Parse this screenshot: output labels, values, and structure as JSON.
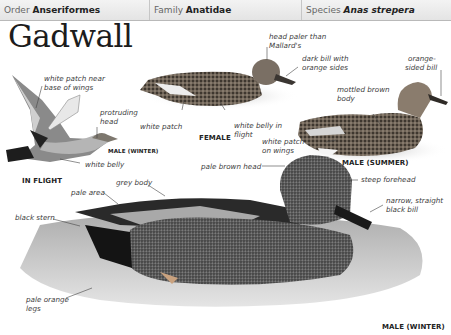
{
  "header": {
    "order_label": "Order",
    "order_value": "Anseriformes",
    "family_label": "Family",
    "family_value": "Anatidae",
    "species_label": "Species",
    "species_value": "Anas strepera"
  },
  "title": "Gadwall",
  "illustrations": {
    "in_flight": {
      "caption": "IN FLIGHT",
      "sub_caption": "MALE (WINTER)",
      "labels": [
        "white patch near",
        "base of wings",
        "protruding",
        "head",
        "white belly"
      ]
    },
    "female": {
      "caption": "FEMALE",
      "labels": [
        "head paler than",
        "Mallard's",
        "dark bill with",
        "orange sides",
        "white patch",
        "white belly in",
        "flight"
      ]
    },
    "male_summer": {
      "caption": "MALE (SUMMER)",
      "labels": [
        "orange-",
        "sided bill",
        "mottled brown",
        "body",
        "white patch",
        "on wings"
      ]
    },
    "male_winter": {
      "caption": "MALE (WINTER)",
      "labels": [
        "pale brown head",
        "steep forehead",
        "narrow, straight",
        "black bill",
        "grey body",
        "pale area",
        "black stern",
        "pale orange",
        "legs"
      ]
    }
  },
  "colors": {
    "header_bg": "#e9e9e9",
    "header_border": "#b9b9b9",
    "text": "#222222"
  }
}
